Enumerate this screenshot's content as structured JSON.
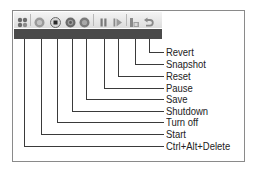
{
  "toolbar": {
    "buttons": [
      {
        "id": "ctrl-alt-delete",
        "label": "Ctrl+Alt+Delete",
        "icon": "ctrl-alt-delete-icon",
        "x": 23,
        "label_y": 146
      },
      {
        "id": "start",
        "label": "Start",
        "icon": "start-icon",
        "x": 40,
        "label_y": 134
      },
      {
        "id": "turn-off",
        "label": "Turn off",
        "icon": "turn-off-icon",
        "x": 56,
        "label_y": 122
      },
      {
        "id": "shutdown",
        "label": "Shutdown",
        "icon": "shutdown-icon",
        "x": 71,
        "label_y": 111
      },
      {
        "id": "save",
        "label": "Save",
        "icon": "save-icon",
        "x": 85,
        "label_y": 99
      },
      {
        "id": "pause",
        "label": "Pause",
        "icon": "pause-icon",
        "x": 103,
        "label_y": 88
      },
      {
        "id": "reset",
        "label": "Reset",
        "icon": "reset-icon",
        "x": 117,
        "label_y": 76
      },
      {
        "id": "snapshot",
        "label": "Snapshot",
        "icon": "snapshot-icon",
        "x": 134,
        "label_y": 64
      },
      {
        "id": "revert",
        "label": "Revert",
        "icon": "revert-icon",
        "x": 148,
        "label_y": 52
      }
    ]
  },
  "labels": {
    "revert": "Revert",
    "snapshot": "Snapshot",
    "reset": "Reset",
    "pause": "Pause",
    "save": "Save",
    "shutdown": "Shutdown",
    "turn_off": "Turn off",
    "start": "Start",
    "ctrl_alt_delete": "Ctrl+Alt+Delete"
  },
  "colors": {
    "toolbar_bg": "#e8e8e8",
    "dark_bar": "#4a4a4a",
    "icon_gray": "#8c8c8c",
    "icon_dark": "#5a5a5a",
    "leader_line": "#3a3a3a",
    "frame_border": "#8a8a8a"
  }
}
